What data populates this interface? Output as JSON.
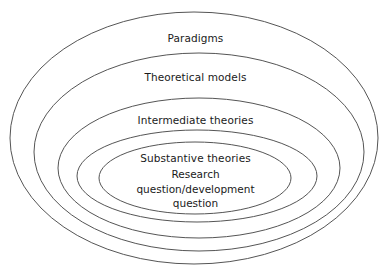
{
  "diagram": {
    "type": "concentric-ellipses",
    "background_color": "#ffffff",
    "stroke_color": "#555555",
    "text_color": "#1a1a1a",
    "rings": [
      {
        "index": 1,
        "label": "Paradigms",
        "cx": 194,
        "cy": 138,
        "rx": 184,
        "ry": 126
      },
      {
        "index": 2,
        "label": "Theoretical models",
        "cx": 199,
        "cy": 152,
        "rx": 165,
        "ry": 99
      },
      {
        "index": 3,
        "label": "Intermediate theories",
        "cx": 199,
        "cy": 168,
        "rx": 141,
        "ry": 70
      },
      {
        "index": 4,
        "label": "Substantive theories",
        "cx": 197,
        "cy": 176,
        "rx": 120,
        "ry": 46
      },
      {
        "index": 5,
        "label": "",
        "cx": 195,
        "cy": 178,
        "rx": 96,
        "ry": 36
      }
    ],
    "core_text": {
      "lines": [
        "Research",
        "question/development",
        "question"
      ]
    }
  }
}
